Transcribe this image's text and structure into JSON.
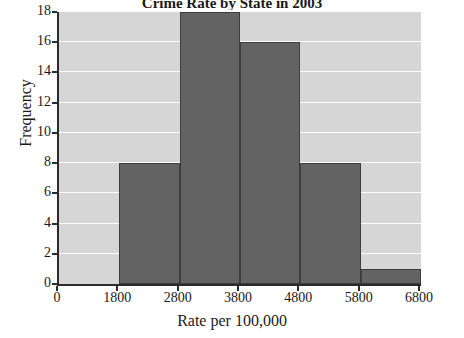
{
  "chart_data": {
    "type": "bar",
    "title": "Crime Rate by State in 2003",
    "xlabel": "Rate per 100,000",
    "ylabel": "Frequency",
    "categories": [
      "1800-2800",
      "2800-3800",
      "3800-4800",
      "4800-5800",
      "5800-6800"
    ],
    "bin_edges": [
      1800,
      2800,
      3800,
      4800,
      5800,
      6800
    ],
    "values": [
      8,
      18,
      16,
      8,
      1
    ],
    "xlim": [
      800,
      6800
    ],
    "ylim": [
      0,
      18
    ],
    "xticks": [
      800,
      1800,
      2800,
      3800,
      4800,
      5800,
      6800
    ],
    "xtick_labels": [
      "0",
      "1800",
      "2800",
      "3800",
      "4800",
      "5800",
      "6800"
    ],
    "yticks": [
      0,
      2,
      4,
      6,
      8,
      10,
      12,
      14,
      16,
      18
    ],
    "ytick_labels": [
      "0",
      "2",
      "4",
      "6",
      "8",
      "10",
      "12",
      "14",
      "16",
      "18"
    ],
    "grid": true,
    "legend": "none",
    "colors": {
      "bar_fill": "#636363",
      "bar_edge": "#3d3d3d",
      "plot_background": "#d6d6d6",
      "gridline": "#ffffff",
      "axis": "#2b2b2b",
      "text": "#1a1a1a"
    }
  }
}
